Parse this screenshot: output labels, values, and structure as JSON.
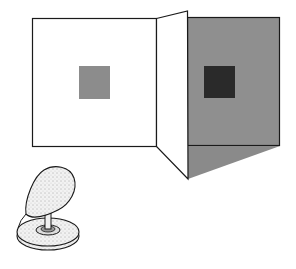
{
  "figure": {
    "title": "",
    "colors": {
      "background": "#ffffff",
      "lit_panel": "#ffffff",
      "lit_square": "#8c8c8c",
      "shadow_panel": "#8f8f8f",
      "shadow_square": "#2a2a2a",
      "cast_shadow": "#8a8a8a",
      "outline": "#1a1a1a",
      "lamp_fill": "#e8e8e8"
    },
    "elements": {
      "left_panel": "lit panel",
      "hinge_panel": "folded partition",
      "right_panel": "shadowed panel",
      "lamp": "lamp"
    }
  }
}
